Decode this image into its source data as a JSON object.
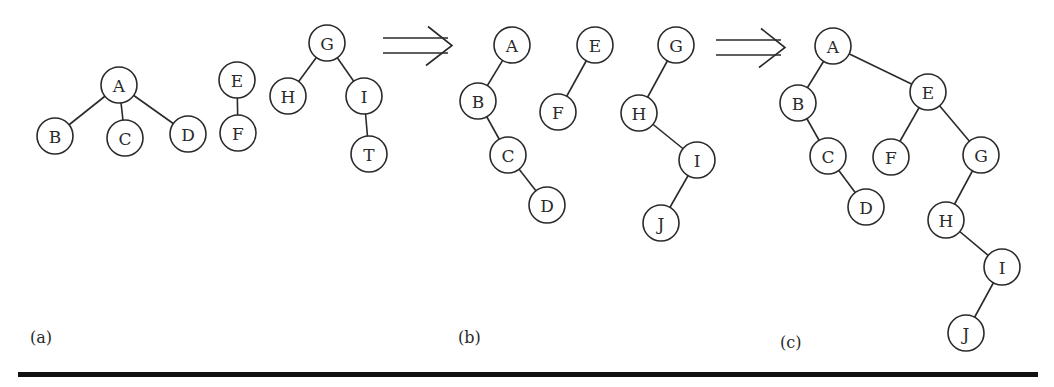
{
  "diagram": {
    "node_radius": 18,
    "colors": {
      "stroke": "#2a2a2a",
      "fill": "#ffffff",
      "rule": "#111111"
    },
    "panels": [
      {
        "id": "a",
        "label": "(a)",
        "label_pos": [
          30,
          343
        ],
        "nodes": [
          {
            "id": "A",
            "label": "A",
            "x": 119,
            "y": 85
          },
          {
            "id": "B",
            "label": "B",
            "x": 55,
            "y": 136
          },
          {
            "id": "C",
            "label": "C",
            "x": 125,
            "y": 138
          },
          {
            "id": "D",
            "label": "D",
            "x": 188,
            "y": 134
          },
          {
            "id": "E",
            "label": "E",
            "x": 237,
            "y": 80
          },
          {
            "id": "F",
            "label": "F",
            "x": 238,
            "y": 133
          },
          {
            "id": "G",
            "label": "G",
            "x": 327,
            "y": 43
          },
          {
            "id": "H",
            "label": "H",
            "x": 288,
            "y": 96
          },
          {
            "id": "I",
            "label": "I",
            "x": 364,
            "y": 96
          },
          {
            "id": "T",
            "label": "T",
            "x": 369,
            "y": 154
          }
        ],
        "edges": [
          [
            "A",
            "B"
          ],
          [
            "A",
            "C"
          ],
          [
            "A",
            "D"
          ],
          [
            "E",
            "F"
          ],
          [
            "G",
            "H"
          ],
          [
            "G",
            "I"
          ],
          [
            "I",
            "T"
          ]
        ]
      },
      {
        "id": "b",
        "label": "(b)",
        "label_pos": [
          458,
          343
        ],
        "nodes": [
          {
            "id": "A",
            "label": "A",
            "x": 512,
            "y": 45
          },
          {
            "id": "B",
            "label": "B",
            "x": 478,
            "y": 101
          },
          {
            "id": "C",
            "label": "C",
            "x": 508,
            "y": 155
          },
          {
            "id": "D",
            "label": "D",
            "x": 547,
            "y": 205
          },
          {
            "id": "E",
            "label": "E",
            "x": 595,
            "y": 45
          },
          {
            "id": "F",
            "label": "F",
            "x": 558,
            "y": 112
          },
          {
            "id": "G",
            "label": "G",
            "x": 676,
            "y": 45
          },
          {
            "id": "H",
            "label": "H",
            "x": 639,
            "y": 113
          },
          {
            "id": "I",
            "label": "I",
            "x": 697,
            "y": 160
          },
          {
            "id": "J",
            "label": "J",
            "x": 661,
            "y": 223
          }
        ],
        "edges": [
          [
            "A",
            "B"
          ],
          [
            "B",
            "C"
          ],
          [
            "C",
            "D"
          ],
          [
            "E",
            "F"
          ],
          [
            "G",
            "H"
          ],
          [
            "H",
            "I"
          ],
          [
            "I",
            "J"
          ]
        ]
      },
      {
        "id": "c",
        "label": "(c)",
        "label_pos": [
          780,
          348
        ],
        "nodes": [
          {
            "id": "A",
            "label": "A",
            "x": 833,
            "y": 46
          },
          {
            "id": "B",
            "label": "B",
            "x": 798,
            "y": 103
          },
          {
            "id": "C",
            "label": "C",
            "x": 828,
            "y": 156
          },
          {
            "id": "D",
            "label": "D",
            "x": 866,
            "y": 207
          },
          {
            "id": "E",
            "label": "E",
            "x": 928,
            "y": 92
          },
          {
            "id": "F",
            "label": "F",
            "x": 891,
            "y": 157
          },
          {
            "id": "G",
            "label": "G",
            "x": 981,
            "y": 155
          },
          {
            "id": "H",
            "label": "H",
            "x": 946,
            "y": 220
          },
          {
            "id": "I",
            "label": "I",
            "x": 1002,
            "y": 267
          },
          {
            "id": "J",
            "label": "J",
            "x": 966,
            "y": 333
          }
        ],
        "edges": [
          [
            "A",
            "B"
          ],
          [
            "A",
            "E"
          ],
          [
            "B",
            "C"
          ],
          [
            "C",
            "D"
          ],
          [
            "E",
            "F"
          ],
          [
            "E",
            "G"
          ],
          [
            "G",
            "H"
          ],
          [
            "H",
            "I"
          ],
          [
            "I",
            "J"
          ]
        ]
      }
    ],
    "arrows": [
      {
        "id": "arrow-a-to-b",
        "x1": 383,
        "x2": 452,
        "y_top": 38,
        "y_bottom": 53
      },
      {
        "id": "arrow-b-to-c",
        "x1": 716,
        "x2": 785,
        "y_top": 40,
        "y_bottom": 55
      }
    ],
    "rule": {
      "x": 18,
      "y": 372,
      "width": 1020,
      "height": 5
    }
  }
}
